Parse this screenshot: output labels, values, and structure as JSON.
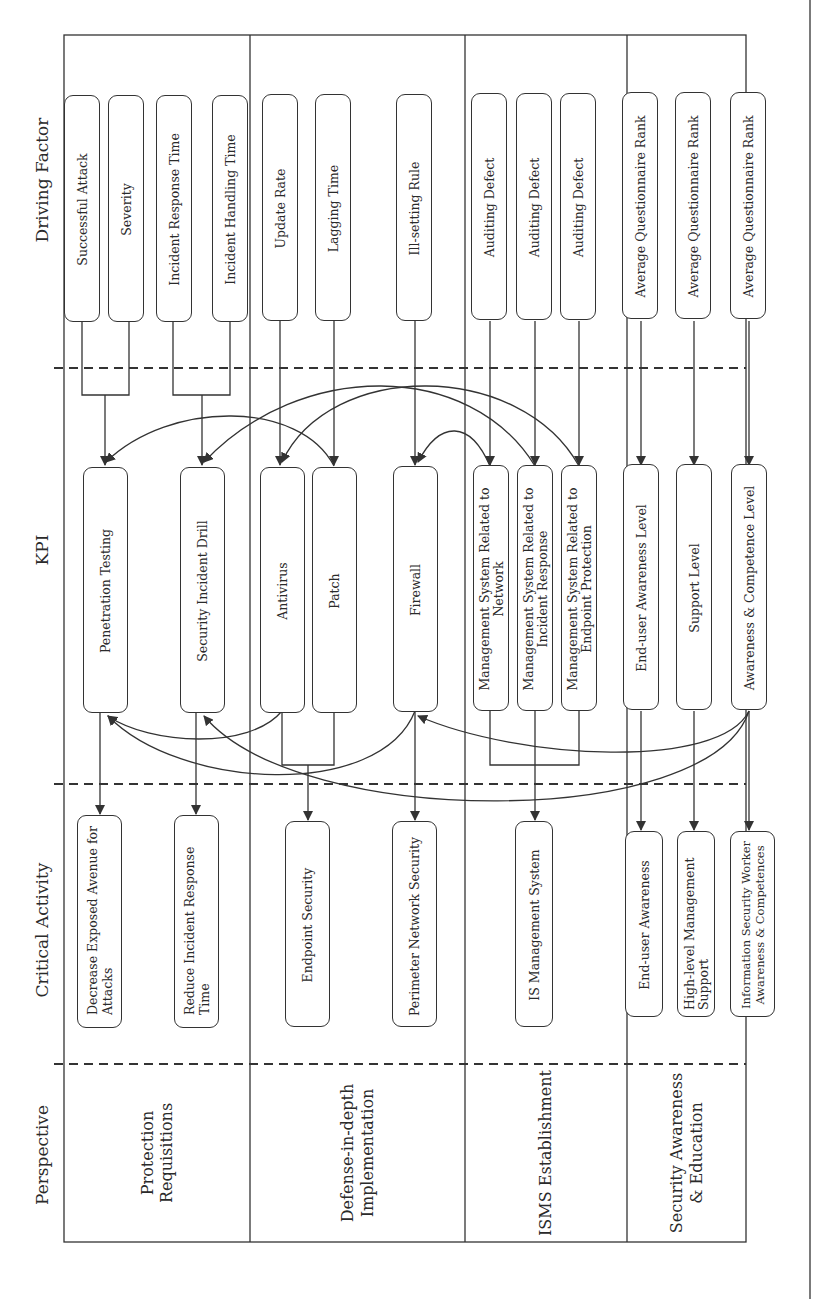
{
  "headers": {
    "driving_factor": "Driving Factor",
    "kpi": "KPI",
    "critical_activity": "Critical Activity",
    "perspective": "Perspective"
  },
  "perspectives": [
    {
      "id": "protection",
      "label": "Protection Requisitions"
    },
    {
      "id": "defense",
      "label": "Defense-in-depth Implementation"
    },
    {
      "id": "isms",
      "label": "ISMS Establishment"
    },
    {
      "id": "awareness",
      "label": "Security Awareness & Education"
    }
  ],
  "driving_factors": [
    {
      "id": "df1",
      "label": "Successful Attack"
    },
    {
      "id": "df2",
      "label": "Severity"
    },
    {
      "id": "df3",
      "label": "Incident Response Time"
    },
    {
      "id": "df4",
      "label": "Incident Handling Time"
    },
    {
      "id": "df5",
      "label": "Update Rate"
    },
    {
      "id": "df6",
      "label": "Lagging Time"
    },
    {
      "id": "df7",
      "label": "Ill-setting Rule"
    },
    {
      "id": "df8",
      "label": "Auditing Defect"
    },
    {
      "id": "df9",
      "label": "Auditing Defect"
    },
    {
      "id": "df10",
      "label": "Auditing Defect"
    },
    {
      "id": "df11",
      "label": "Average Questionnaire Rank"
    },
    {
      "id": "df12",
      "label": "Average Questionnaire Rank"
    },
    {
      "id": "df13",
      "label": "Average Questionnaire Rank"
    }
  ],
  "kpis": [
    {
      "id": "k1",
      "label": "Penetration Testing"
    },
    {
      "id": "k2",
      "label": "Security Incident Drill"
    },
    {
      "id": "k3",
      "label": "Antivirus"
    },
    {
      "id": "k4",
      "label": "Patch"
    },
    {
      "id": "k5",
      "label": "Firewall"
    },
    {
      "id": "k6",
      "label": "Management System Related to Network"
    },
    {
      "id": "k7",
      "label": "Management System Related to Incident Response"
    },
    {
      "id": "k8",
      "label": "Management System Related to Endpoint Protection"
    },
    {
      "id": "k9",
      "label": "End-user Awareness Level"
    },
    {
      "id": "k10",
      "label": "Support Level"
    },
    {
      "id": "k11",
      "label": "Awareness & Competence Level"
    }
  ],
  "critical_activities": [
    {
      "id": "c1",
      "label": "Decrease Exposed Avenue for Attacks"
    },
    {
      "id": "c2",
      "label": "Reduce Incident Response Time"
    },
    {
      "id": "c3",
      "label": "Endpoint Security"
    },
    {
      "id": "c4",
      "label": "Perimeter Network Security"
    },
    {
      "id": "c5",
      "label": "IS Management System"
    },
    {
      "id": "c6",
      "label": "End-user Awareness"
    },
    {
      "id": "c7",
      "label": "High-level Management Support"
    },
    {
      "id": "c8",
      "label": "Information Security Worker Awareness & Competences"
    }
  ],
  "edges": [
    {
      "from": [
        "df1",
        "df2"
      ],
      "to": "k1"
    },
    {
      "from": [
        "df3",
        "df4"
      ],
      "to": "k2"
    },
    {
      "from": [
        "df5"
      ],
      "to": "k3"
    },
    {
      "from": [
        "df6"
      ],
      "to": "k4"
    },
    {
      "from": [
        "df7"
      ],
      "to": "k5"
    },
    {
      "from": [
        "df8"
      ],
      "to": "k6"
    },
    {
      "from": [
        "df9"
      ],
      "to": "k7"
    },
    {
      "from": [
        "df10"
      ],
      "to": "k8"
    },
    {
      "from": [
        "df11"
      ],
      "to": "k9"
    },
    {
      "from": [
        "df12"
      ],
      "to": "k10"
    },
    {
      "from": [
        "df13"
      ],
      "to": "k11"
    },
    {
      "from": [
        "k4"
      ],
      "to": "k1",
      "curved": true
    },
    {
      "from": [
        "k7"
      ],
      "to": "k2",
      "curved": true
    },
    {
      "from": [
        "k8"
      ],
      "to": "k3",
      "curved": true
    },
    {
      "from": [
        "k6"
      ],
      "to": "k5",
      "curved": true
    },
    {
      "from": [
        "k3"
      ],
      "to": "k1",
      "curved": true
    },
    {
      "from": [
        "k5"
      ],
      "to": "k1",
      "curved": true
    },
    {
      "from": [
        "k11"
      ],
      "to": "k5",
      "curved": true
    },
    {
      "from": [
        "k11"
      ],
      "to": "k2",
      "curved": true
    },
    {
      "from": [
        "k1"
      ],
      "to": "c1"
    },
    {
      "from": [
        "k2"
      ],
      "to": "c2"
    },
    {
      "from": [
        "k3",
        "k4"
      ],
      "to": "c3"
    },
    {
      "from": [
        "k5"
      ],
      "to": "c4"
    },
    {
      "from": [
        "k6",
        "k7",
        "k8"
      ],
      "to": "c5"
    },
    {
      "from": [
        "k9"
      ],
      "to": "c6"
    },
    {
      "from": [
        "k10"
      ],
      "to": "c7"
    },
    {
      "from": [
        "k11"
      ],
      "to": "c8"
    }
  ],
  "colors": {
    "line": "#333333",
    "background": "#ffffff"
  }
}
